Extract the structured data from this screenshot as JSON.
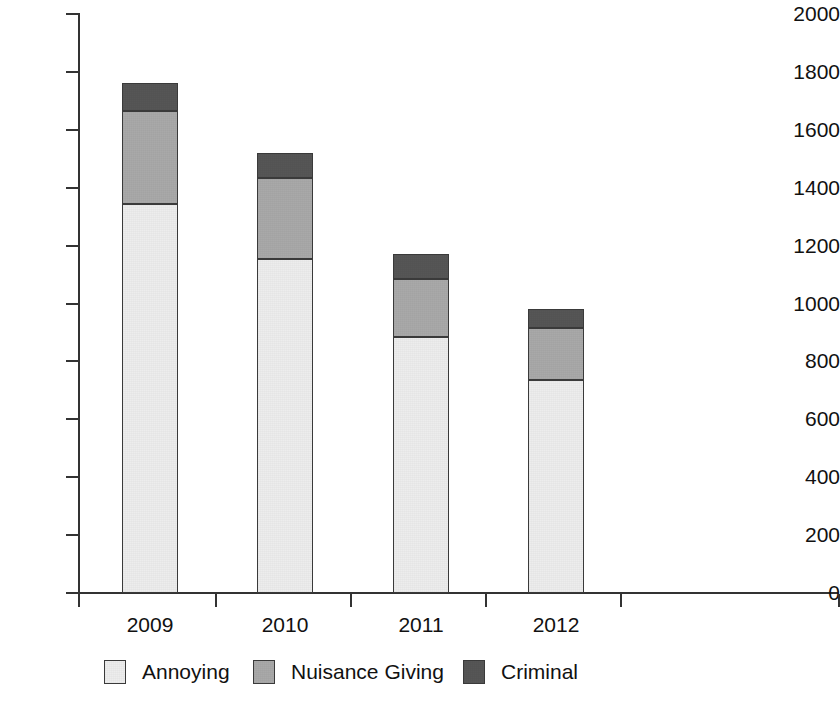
{
  "chart_data": {
    "type": "bar",
    "subtype": "stacked-vertical",
    "title": "",
    "xlabel": "",
    "ylabel": "",
    "categories": [
      "2009",
      "2010",
      "2011",
      "2012"
    ],
    "series": [
      {
        "name": "Annoying",
        "color": "#ededed",
        "values": [
          1345,
          1155,
          885,
          735
        ]
      },
      {
        "name": "Nuisance Giving",
        "color": "#a9a9a9",
        "values": [
          320,
          280,
          200,
          180
        ]
      },
      {
        "name": "Criminal",
        "color": "#565656",
        "values": [
          95,
          85,
          85,
          65
        ]
      }
    ],
    "totals": [
      1760,
      1520,
      1170,
      980
    ],
    "ylim": [
      0,
      2000
    ],
    "y_ticks": [
      0,
      200,
      400,
      600,
      800,
      1000,
      1200,
      1400,
      1600,
      1800,
      2000
    ],
    "y_tick_labels": [
      "0",
      "200",
      "400",
      "600",
      "800",
      "1000",
      "1200",
      "1400",
      "1600",
      "1800",
      "2000"
    ],
    "grid": false,
    "legend_position": "bottom"
  },
  "axes": {
    "y_tick_labels": [
      "2000",
      "1800",
      "1600",
      "1400",
      "1200",
      "1000",
      "800",
      "600",
      "400",
      "200",
      "0"
    ],
    "x_tick_labels": [
      "2009",
      "2010",
      "2011",
      "2012"
    ]
  },
  "legend": {
    "items": [
      {
        "label": "Annoying",
        "color": "#ededed"
      },
      {
        "label": "Nuisance Giving",
        "color": "#a9a9a9"
      },
      {
        "label": "Criminal",
        "color": "#565656"
      }
    ]
  }
}
